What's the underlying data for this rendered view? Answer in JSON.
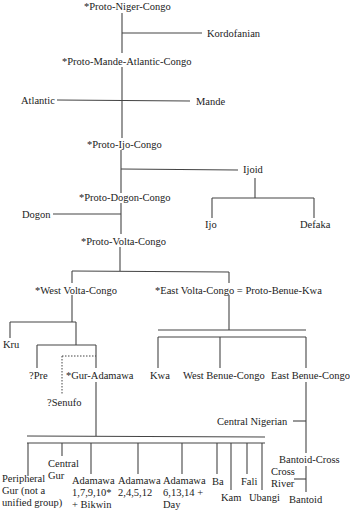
{
  "diagram": {
    "type": "language-family-tree",
    "nodes": {
      "proto_niger_congo": "*Proto-Niger-Congo",
      "kordofanian": "Kordofanian",
      "proto_mande_atlantic_congo": "*Proto-Mande-Atlantic-Congo",
      "atlantic": "Atlantic",
      "mande": "Mande",
      "proto_ijo_congo": "*Proto-Ijo-Congo",
      "ijoid": "Ijoid",
      "ijo": "Ijo",
      "defaka": "Defaka",
      "proto_dogon_congo": "*Proto-Dogon-Congo",
      "dogon": "Dogon",
      "proto_volta_congo": "*Proto-Volta-Congo",
      "west_volta_congo": "*West Volta-Congo",
      "east_volta_congo": "*East Volta-Congo = Proto-Benue-Kwa",
      "kru": "Kru",
      "pre": "?Pre",
      "senufo": "?Senufo",
      "gur_adamawa": "*Gur-Adamawa",
      "kwa": "Kwa",
      "west_benue_congo": "West Benue-Congo",
      "east_benue_congo": "East Benue-Congo",
      "central_nigerian": "Central Nigerian",
      "bantoid_cross": "Bantoid-Cross",
      "cross_river": "Cross\nRiver",
      "bantoid": "Bantoid",
      "peripheral_gur": "Peripheral\nGur (not a\nunified group)",
      "central_gur": "Central\nGur",
      "adamawa_1": "Adamawa\n1,7,9,10*\n+ Bikwin",
      "adamawa_2": "Adamawa\n2,4,5,12",
      "adamawa_3": "Adamawa\n6,13,14 +\nDay",
      "ba": "Ba",
      "kam": "Kam",
      "fali": "Fali",
      "ubangi": "Ubangi"
    }
  }
}
